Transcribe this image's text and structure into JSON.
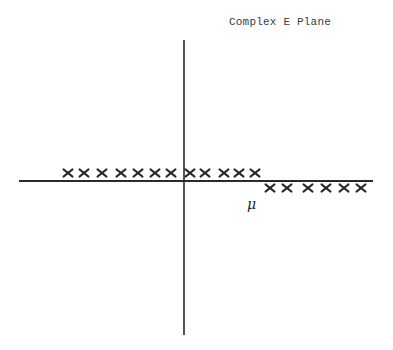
{
  "diagram": {
    "title": "Complex E Plane",
    "mu_label": "μ",
    "axes": {
      "horizontal": {
        "x1": 19,
        "x2": 373,
        "y": 181
      },
      "vertical": {
        "x": 184,
        "y1": 40,
        "y2": 335
      }
    },
    "pole_groups": [
      {
        "name": "left-of-imag-axis-above-real-axis",
        "y": 173,
        "xs": [
          68,
          84,
          102,
          121,
          138,
          155,
          171
        ]
      },
      {
        "name": "right-of-imag-axis-above-real-axis",
        "y": 173,
        "xs": [
          190,
          205,
          224,
          239,
          255
        ]
      },
      {
        "name": "right-of-mu-below-real-axis",
        "y": 188,
        "xs": [
          270,
          287,
          308,
          326,
          344,
          361
        ]
      }
    ],
    "colors": {
      "ink": "#2a2a2a",
      "background": "#ffffff"
    }
  }
}
